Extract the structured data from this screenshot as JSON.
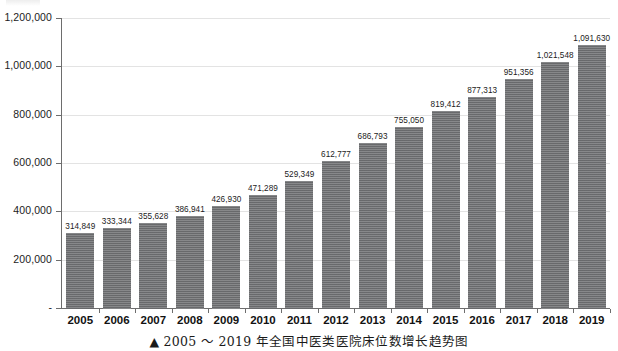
{
  "caption": {
    "marker": "▲",
    "text": "▲ 2005 ～ 2019 年全国中医类医院床位数增长趋势图"
  },
  "style": {
    "bar_color": "#6f7072",
    "gridline_color": "#e3e3e3",
    "axis_color": "#6d6d6d",
    "text_color": "#1b1b1b",
    "background": "#ffffff"
  },
  "chart_data": {
    "type": "bar",
    "xlabel": "",
    "ylabel": "",
    "ylim": [
      0,
      1200000
    ],
    "grid": true,
    "legend": false,
    "categories": [
      "2005",
      "2006",
      "2007",
      "2008",
      "2009",
      "2010",
      "2011",
      "2012",
      "2013",
      "2014",
      "2015",
      "2016",
      "2017",
      "2018",
      "2019"
    ],
    "values": [
      314849,
      333344,
      355628,
      386941,
      426930,
      471289,
      529349,
      612777,
      686793,
      755050,
      819412,
      877313,
      951356,
      1021548,
      1091630
    ],
    "value_labels": [
      "314,849",
      "333,344",
      "355,628",
      "386,941",
      "426,930",
      "471,289",
      "529,349",
      "612,777",
      "686,793",
      "755,050",
      "819,412",
      "877,313",
      "951,356",
      "1,021,548",
      "1,091,630"
    ],
    "yticks": [
      0,
      200000,
      400000,
      600000,
      800000,
      1000000,
      1200000
    ],
    "ytick_labels": [
      "-",
      "200,000",
      "400,000",
      "600,000",
      "800,000",
      "1,000,000",
      "1,200,000"
    ]
  }
}
